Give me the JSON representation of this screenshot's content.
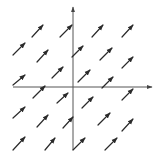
{
  "diagram": {
    "type": "vector-field",
    "colors": {
      "background": "#ffffff",
      "ink": "#2a2a2a",
      "axis": "#555555"
    },
    "axes": {
      "x": {
        "x1": 13,
        "y1": 87,
        "x2": 152,
        "y2": 87
      },
      "y": {
        "x1": 73,
        "y1": 150,
        "x2": 73,
        "y2": 7
      }
    },
    "arrows": [
      {
        "x1": 32,
        "y1": 37,
        "x2": 43,
        "y2": 25
      },
      {
        "x1": 60,
        "y1": 37,
        "x2": 72,
        "y2": 25
      },
      {
        "x1": 92,
        "y1": 37,
        "x2": 103,
        "y2": 25
      },
      {
        "x1": 122,
        "y1": 37,
        "x2": 133,
        "y2": 25
      },
      {
        "x1": 13,
        "y1": 55,
        "x2": 25,
        "y2": 43
      },
      {
        "x1": 37,
        "y1": 62,
        "x2": 48,
        "y2": 50
      },
      {
        "x1": 72,
        "y1": 57,
        "x2": 83,
        "y2": 46
      },
      {
        "x1": 100,
        "y1": 60,
        "x2": 112,
        "y2": 48
      },
      {
        "x1": 122,
        "y1": 68,
        "x2": 133,
        "y2": 57
      },
      {
        "x1": 13,
        "y1": 85,
        "x2": 25,
        "y2": 75
      },
      {
        "x1": 52,
        "y1": 78,
        "x2": 63,
        "y2": 67
      },
      {
        "x1": 78,
        "y1": 82,
        "x2": 90,
        "y2": 70
      },
      {
        "x1": 102,
        "y1": 88,
        "x2": 113,
        "y2": 77
      },
      {
        "x1": 33,
        "y1": 98,
        "x2": 45,
        "y2": 86
      },
      {
        "x1": 57,
        "y1": 103,
        "x2": 68,
        "y2": 93
      },
      {
        "x1": 82,
        "y1": 108,
        "x2": 93,
        "y2": 97
      },
      {
        "x1": 122,
        "y1": 100,
        "x2": 133,
        "y2": 89
      },
      {
        "x1": 13,
        "y1": 118,
        "x2": 25,
        "y2": 107
      },
      {
        "x1": 37,
        "y1": 127,
        "x2": 48,
        "y2": 115
      },
      {
        "x1": 63,
        "y1": 128,
        "x2": 73,
        "y2": 117
      },
      {
        "x1": 98,
        "y1": 125,
        "x2": 110,
        "y2": 113
      },
      {
        "x1": 122,
        "y1": 131,
        "x2": 133,
        "y2": 119
      },
      {
        "x1": 13,
        "y1": 150,
        "x2": 25,
        "y2": 137
      },
      {
        "x1": 45,
        "y1": 150,
        "x2": 55,
        "y2": 138
      },
      {
        "x1": 73,
        "y1": 150,
        "x2": 85,
        "y2": 138
      },
      {
        "x1": 105,
        "y1": 150,
        "x2": 117,
        "y2": 138
      }
    ]
  }
}
